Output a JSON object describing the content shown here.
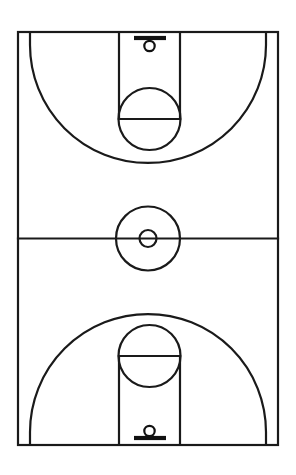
{
  "diagram": {
    "orientation": "vertical",
    "view": "full-court",
    "style": "line-drawing",
    "line_color": "#1a1a1a",
    "background_color": "#ffffff",
    "canvas": {
      "width": 296,
      "height": 475
    }
  },
  "court": {
    "label": "Court Boundary",
    "left": 18,
    "right": 278,
    "top": 32,
    "bottom": 445,
    "width": 260,
    "height": 413,
    "center_x": 148,
    "center_y": 238.5
  },
  "midcourt": {
    "label": "Midcourt Line",
    "y": 238.5,
    "x1": 18,
    "x2": 278
  },
  "center_circle": {
    "label": "Center Circle",
    "cx": 148,
    "cy": 238.5,
    "r": 32
  },
  "center_circle_inner": {
    "label": "Center Restraining Circle",
    "cx": 148,
    "cy": 238.5,
    "r": 8.5
  },
  "halves": [
    {
      "id": "top",
      "label": "Top Half Court",
      "baseline_y": 32,
      "key": {
        "label": "Free Throw Lane (Key)",
        "left": 119,
        "right": 180,
        "top": 32,
        "bottom": 119
      },
      "free_throw_line": {
        "label": "Free Throw Line",
        "y": 119,
        "x1": 119,
        "x2": 180
      },
      "free_throw_circle": {
        "label": "Free Throw Circle",
        "cx": 149.5,
        "cy": 119,
        "r": 31
      },
      "three_point": {
        "label": "Three Point Line",
        "corner_x_left": 30,
        "corner_x_right": 266,
        "corner_straight_top_y": 32,
        "corner_straight_bottom_y": 45,
        "arc_apex_y": 151,
        "arc_center_x": 149.5,
        "arc_radius": 118
      },
      "backboard": {
        "label": "Backboard",
        "y": 38,
        "x1": 134,
        "x2": 166
      },
      "rim": {
        "label": "Rim / Hoop",
        "cx": 149.5,
        "cy": 46,
        "r": 5.2
      }
    },
    {
      "id": "bottom",
      "label": "Bottom Half Court",
      "baseline_y": 445,
      "key": {
        "label": "Free Throw Lane (Key)",
        "left": 119,
        "right": 180,
        "top": 356,
        "bottom": 445
      },
      "free_throw_line": {
        "label": "Free Throw Line",
        "y": 356,
        "x1": 119,
        "x2": 180
      },
      "free_throw_circle": {
        "label": "Free Throw Circle",
        "cx": 149.5,
        "cy": 356,
        "r": 31
      },
      "three_point": {
        "label": "Three Point Line",
        "corner_x_left": 30,
        "corner_x_right": 266,
        "corner_straight_top_y": 432,
        "corner_straight_bottom_y": 445,
        "arc_apex_y": 324,
        "arc_center_x": 149.5,
        "arc_radius": 118
      },
      "backboard": {
        "label": "Backboard",
        "y": 438,
        "x1": 134,
        "x2": 166
      },
      "rim": {
        "label": "Rim / Hoop",
        "cx": 149.5,
        "cy": 431,
        "r": 5.2
      }
    }
  ]
}
